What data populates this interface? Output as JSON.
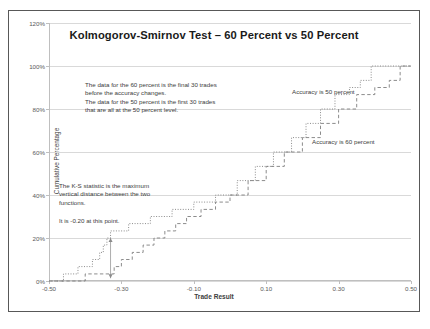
{
  "chart_data": {
    "type": "line",
    "title": "Kolmogorov-Smirnov Test – 60 Percent vs 50 Percent",
    "xlabel": "Trade Result",
    "ylabel": "Cumulative Percentage",
    "xlim": [
      -0.5,
      0.5
    ],
    "ylim": [
      0,
      1.2
    ],
    "grid": true,
    "legend_position": "inline-annotations",
    "x_ticks": [
      "-0.50",
      "-0.30",
      "-0.10",
      "0.10",
      "0.30",
      "0.50"
    ],
    "x_tick_values": [
      -0.5,
      -0.3,
      -0.1,
      0.1,
      0.3,
      0.5
    ],
    "y_ticks": [
      "0%",
      "20%",
      "40%",
      "60%",
      "80%",
      "100%",
      "120%"
    ],
    "y_tick_values": [
      0,
      0.2,
      0.4,
      0.6,
      0.8,
      1.0,
      1.2
    ],
    "series": [
      {
        "name": "Accuracy is 50 percent",
        "style": "dotted",
        "color": "#7f7f7f",
        "x": [
          -0.5,
          -0.46,
          -0.46,
          -0.42,
          -0.42,
          -0.38,
          -0.38,
          -0.36,
          -0.36,
          -0.35,
          -0.35,
          -0.34,
          -0.34,
          -0.33,
          -0.33,
          -0.32,
          -0.32,
          -0.28,
          -0.28,
          -0.22,
          -0.22,
          -0.16,
          -0.16,
          -0.1,
          -0.1,
          -0.04,
          -0.04,
          0.02,
          0.02,
          0.07,
          0.07,
          0.12,
          0.12,
          0.17,
          0.17,
          0.21,
          0.21,
          0.25,
          0.25,
          0.29,
          0.29,
          0.33,
          0.33,
          0.36,
          0.36,
          0.39,
          0.39,
          0.5
        ],
        "y": [
          0.0,
          0.0,
          0.033,
          0.033,
          0.067,
          0.067,
          0.1,
          0.1,
          0.133,
          0.133,
          0.167,
          0.167,
          0.2,
          0.2,
          0.233,
          0.233,
          0.233,
          0.233,
          0.267,
          0.267,
          0.3,
          0.3,
          0.333,
          0.333,
          0.367,
          0.367,
          0.4,
          0.4,
          0.467,
          0.467,
          0.533,
          0.533,
          0.6,
          0.6,
          0.667,
          0.667,
          0.733,
          0.733,
          0.8,
          0.8,
          0.867,
          0.867,
          0.9,
          0.9,
          0.933,
          0.933,
          1.0,
          1.0
        ]
      },
      {
        "name": "Accuracy is 60 percent",
        "style": "dashed",
        "color": "#7f7f7f",
        "x": [
          -0.5,
          -0.4,
          -0.4,
          -0.34,
          -0.34,
          -0.32,
          -0.32,
          -0.3,
          -0.3,
          -0.27,
          -0.27,
          -0.24,
          -0.24,
          -0.21,
          -0.21,
          -0.18,
          -0.18,
          -0.15,
          -0.15,
          -0.12,
          -0.12,
          -0.08,
          -0.08,
          -0.04,
          -0.04,
          0.0,
          0.0,
          0.05,
          0.05,
          0.1,
          0.1,
          0.15,
          0.15,
          0.2,
          0.2,
          0.25,
          0.25,
          0.3,
          0.3,
          0.35,
          0.35,
          0.4,
          0.4,
          0.44,
          0.44,
          0.47,
          0.47,
          0.5
        ],
        "y": [
          0.0,
          0.0,
          0.033,
          0.033,
          0.033,
          0.033,
          0.067,
          0.067,
          0.1,
          0.1,
          0.133,
          0.133,
          0.167,
          0.167,
          0.2,
          0.2,
          0.233,
          0.233,
          0.267,
          0.267,
          0.3,
          0.3,
          0.333,
          0.333,
          0.367,
          0.367,
          0.4,
          0.4,
          0.467,
          0.467,
          0.533,
          0.533,
          0.6,
          0.6,
          0.667,
          0.667,
          0.733,
          0.733,
          0.8,
          0.8,
          0.867,
          0.867,
          0.9,
          0.9,
          0.933,
          0.933,
          1.0,
          1.0
        ]
      }
    ],
    "annotations": {
      "data_note_line1": "The data for the 60 percent is the final 30 trades",
      "data_note_line2": "before the accuracy changes.",
      "data_note_line3": "The data for the 50 percent is the first 30 trades",
      "data_note_line4": "that are all at the 50 percent level.",
      "ks_note_line1": "The K-S statistic is the maximum",
      "ks_note_line2": "vertical distance between the two",
      "ks_note_line3": "functions.",
      "ks_value": "It is -0.20 at this point.",
      "accuracy_50_label": "Accuracy is 50 percent",
      "accuracy_60_label": "Accuracy is 60 percent"
    },
    "ks_marker": {
      "x": -0.33,
      "y_top": 0.2,
      "y_bottom": 0.013
    }
  }
}
